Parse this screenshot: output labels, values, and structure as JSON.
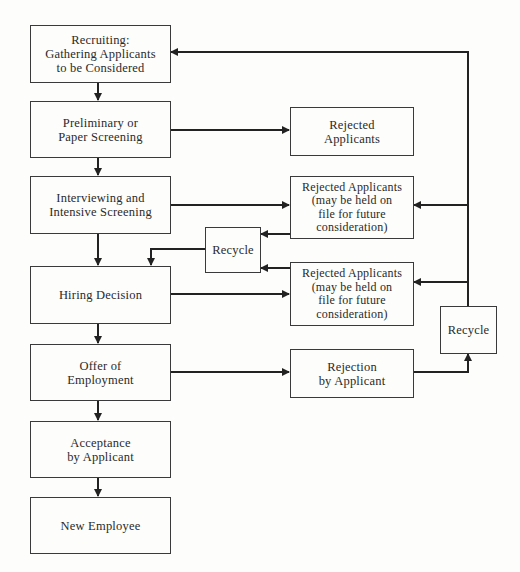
{
  "diagram": {
    "type": "flowchart",
    "main_flow": [
      {
        "id": "recruiting",
        "label": "Recruiting:\nGathering Applicants\nto be Considered"
      },
      {
        "id": "preliminary",
        "label": "Preliminary or\nPaper Screening"
      },
      {
        "id": "interviewing",
        "label": "Interviewing and\nIntensive Screening"
      },
      {
        "id": "hiring",
        "label": "Hiring Decision"
      },
      {
        "id": "offer",
        "label": "Offer of\nEmployment"
      },
      {
        "id": "acceptance",
        "label": "Acceptance\nby Applicant"
      },
      {
        "id": "new_employee",
        "label": "New Employee"
      }
    ],
    "side_nodes": [
      {
        "id": "rejected_1",
        "label": "Rejected\nApplicants"
      },
      {
        "id": "rejected_2",
        "label": "Rejected Applicants\n(may be held on\nfile for future\nconsideration)"
      },
      {
        "id": "rejected_3",
        "label": "Rejected Applicants\n(may be held on\nfile for future\nconsideration)"
      },
      {
        "id": "rejection_by_applicant",
        "label": "Rejection\nby Applicant"
      },
      {
        "id": "recycle_middle",
        "label": "Recycle"
      },
      {
        "id": "recycle_right",
        "label": "Recycle"
      }
    ],
    "edges": [
      {
        "from": "recruiting",
        "to": "preliminary"
      },
      {
        "from": "preliminary",
        "to": "interviewing"
      },
      {
        "from": "interviewing",
        "to": "hiring"
      },
      {
        "from": "hiring",
        "to": "offer"
      },
      {
        "from": "offer",
        "to": "acceptance"
      },
      {
        "from": "acceptance",
        "to": "new_employee"
      },
      {
        "from": "preliminary",
        "to": "rejected_1"
      },
      {
        "from": "interviewing",
        "to": "rejected_2"
      },
      {
        "from": "hiring",
        "to": "rejected_3"
      },
      {
        "from": "offer",
        "to": "rejection_by_applicant"
      },
      {
        "from": "rejected_2",
        "to": "recycle_middle"
      },
      {
        "from": "rejected_3",
        "to": "recycle_middle"
      },
      {
        "from": "recycle_middle",
        "to": "hiring"
      },
      {
        "from": "rejection_by_applicant",
        "to": "recycle_right"
      },
      {
        "from": "recycle_right",
        "to": "recruiting"
      },
      {
        "from": "recycle_right",
        "to": "rejected_2"
      },
      {
        "from": "recycle_right",
        "to": "rejected_3"
      }
    ]
  }
}
